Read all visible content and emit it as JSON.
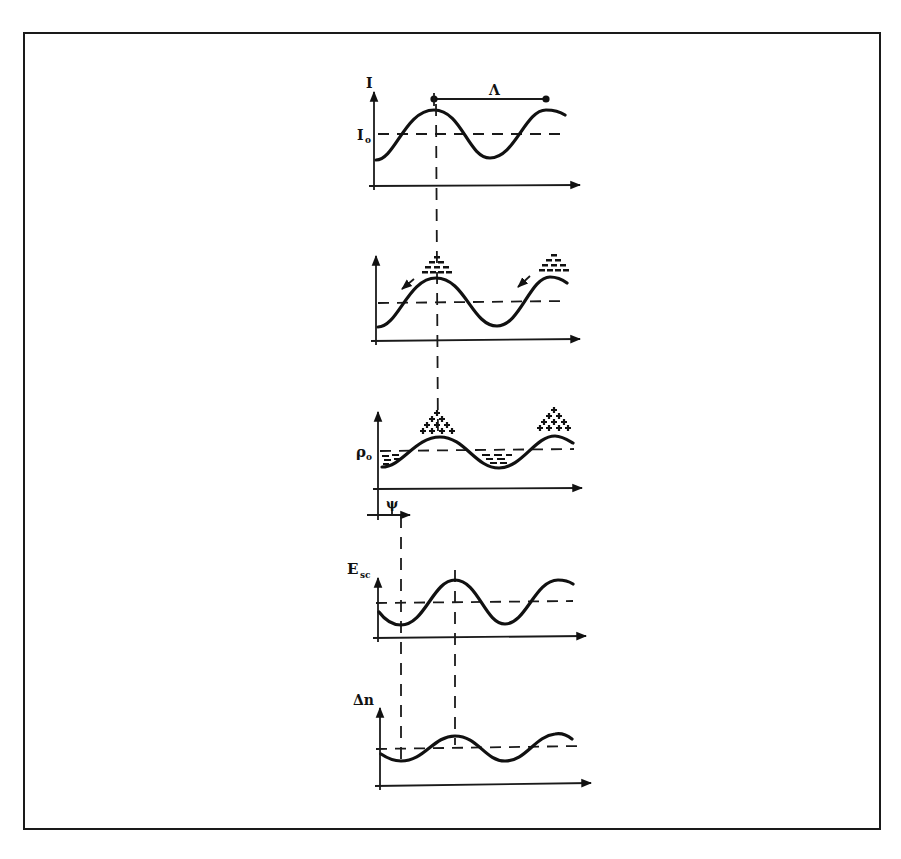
{
  "figure": {
    "type": "photorefractive grating formation schematic",
    "panels": [
      {
        "id": "intensity",
        "y_label": "I",
        "reference_label": "I₀",
        "annotation": "Λ",
        "annotation_meaning": "grating period"
      },
      {
        "id": "charge-migration",
        "y_label": "",
        "annotation": "electrons diffuse from bright regions"
      },
      {
        "id": "charge-density",
        "y_label": "ρ₀",
        "annotation": "positive ions at peaks, trapped electrons in troughs"
      },
      {
        "id": "space-charge-field",
        "y_label": "E",
        "y_label_sub": "sc",
        "phase_label": "ψ"
      },
      {
        "id": "refractive-index",
        "y_label": "Δn"
      }
    ],
    "labels": {
      "I": "I",
      "I0_main": "I",
      "I0_sub": "o",
      "Lambda": "Λ",
      "rho0_main": "ρ",
      "rho0_sub": "o",
      "psi": "ψ",
      "Esc_main": "E",
      "Esc_sub": "sc",
      "dn": "Δn"
    },
    "colors": {
      "ink": "#111111",
      "background": "#ffffff",
      "frame": "#1a1a1a"
    }
  }
}
